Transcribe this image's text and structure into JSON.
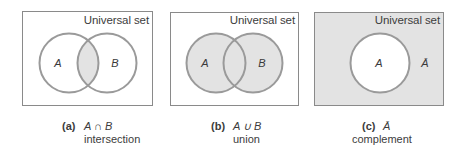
{
  "colors": {
    "frame_stroke": "#8a8a8a",
    "circle_stroke": "#9a9a9a",
    "shade_fill": "#e3e3e3",
    "background": "#ffffff",
    "text": "#3c3c3c"
  },
  "panels": [
    {
      "id": "a",
      "universe_label": "Universal set",
      "set_labels": {
        "a": "A",
        "b": "B"
      },
      "shaded_region": "intersection",
      "caption": {
        "letter": "(a)",
        "expression": "A ∩ B",
        "name": "intersection"
      }
    },
    {
      "id": "b",
      "universe_label": "Universal set",
      "set_labels": {
        "a": "A",
        "b": "B"
      },
      "shaded_region": "union",
      "caption": {
        "letter": "(b)",
        "expression": "A ∪ B",
        "name": "union"
      }
    },
    {
      "id": "c",
      "universe_label": "Universal set",
      "set_labels": {
        "a": "A",
        "complement": "Ā"
      },
      "shaded_region": "complement",
      "caption": {
        "letter": "(c)",
        "expression": "Ā",
        "name": "complement"
      }
    }
  ]
}
